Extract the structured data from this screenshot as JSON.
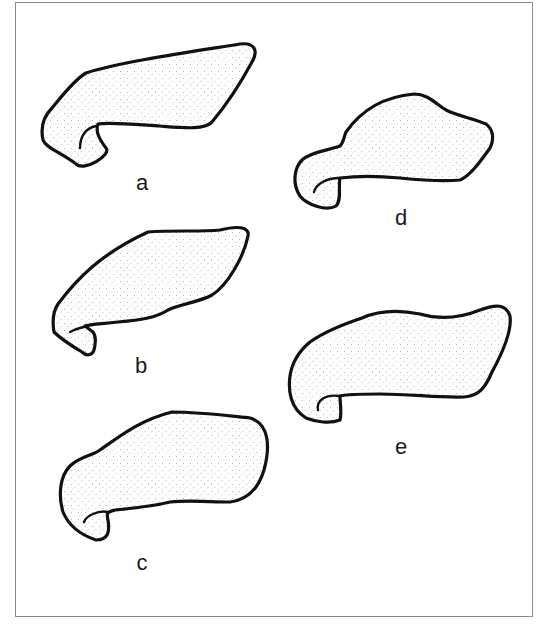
{
  "figure": {
    "stroke_color": "#111111",
    "fill_color": "#ffffff",
    "stipple_color": "#9a9a9a",
    "border_color": "#8a8a8a"
  },
  "panels": [
    {
      "id": "a",
      "label": "a",
      "label_pos": {
        "x": 142,
        "y": 172
      }
    },
    {
      "id": "b",
      "label": "b",
      "label_pos": {
        "x": 141,
        "y": 356
      }
    },
    {
      "id": "c",
      "label": "c",
      "label_pos": {
        "x": 142,
        "y": 553
      }
    },
    {
      "id": "d",
      "label": "d",
      "label_pos": {
        "x": 401,
        "y": 208
      }
    },
    {
      "id": "e",
      "label": "e",
      "label_pos": {
        "x": 401,
        "y": 437
      }
    }
  ]
}
